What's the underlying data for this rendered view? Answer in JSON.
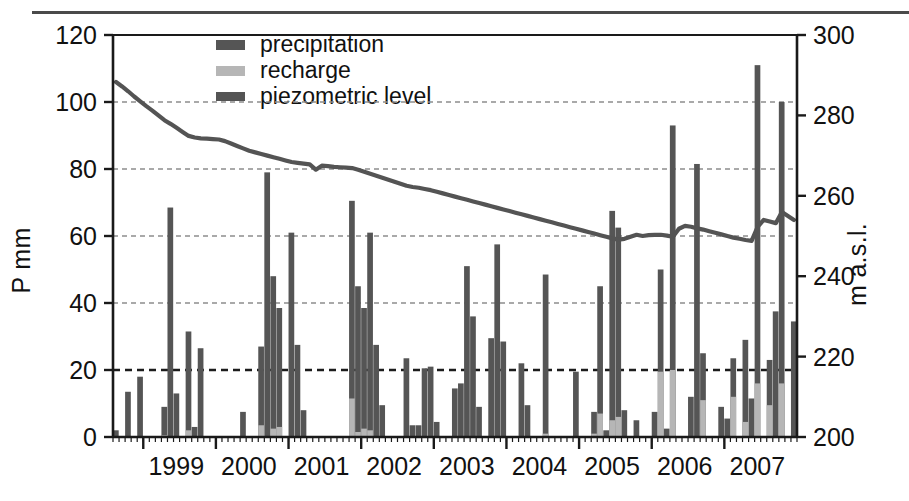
{
  "figure": {
    "axis_left_title": "P mm",
    "axis_right_title": "m a.s.l."
  },
  "legend": {
    "items": [
      {
        "label": "precipitation",
        "swatch": "bar-precip",
        "color": "#555555"
      },
      {
        "label": "recharge",
        "swatch": "bar-recharge",
        "color": "#b6b6b6"
      },
      {
        "label": "piezometric level",
        "swatch": "line-piezo",
        "color": "#545454"
      }
    ]
  },
  "axes": {
    "left_ticks": [
      "0",
      "20",
      "40",
      "60",
      "80",
      "100",
      "120"
    ],
    "right_ticks": [
      "200",
      "220",
      "240",
      "260",
      "280",
      "300"
    ],
    "x_ticks": [
      "1999",
      "2000",
      "2001",
      "2002",
      "2003",
      "2004",
      "2005",
      "2006",
      "2007"
    ]
  },
  "chart_data": {
    "type": "bar",
    "title": "",
    "xlabel": "",
    "ylabel": "P mm",
    "y2label": "m a.s.l.",
    "ylim": [
      0,
      120
    ],
    "y2lim": [
      200,
      300
    ],
    "grid": true,
    "grid_values": [
      20,
      40,
      60,
      80,
      100
    ],
    "emphasized_gridline": 20,
    "legend_position": "top-center",
    "x_tick_labels": [
      "1999",
      "2000",
      "2001",
      "2002",
      "2003",
      "2004",
      "2005",
      "2006",
      "2007"
    ],
    "x_tick_months": [
      "1999-01",
      "2000-01",
      "2001-01",
      "2002-01",
      "2003-01",
      "2004-01",
      "2005-01",
      "2006-01",
      "2007-01"
    ],
    "x_minor_tick_interval_months": 1,
    "x_range_months": [
      "1998-08",
      "2007-12"
    ],
    "months": [
      "1998-08",
      "1998-09",
      "1998-10",
      "1998-11",
      "1998-12",
      "1999-01",
      "1999-02",
      "1999-03",
      "1999-04",
      "1999-05",
      "1999-06",
      "1999-07",
      "1999-08",
      "1999-09",
      "1999-10",
      "1999-11",
      "1999-12",
      "2000-01",
      "2000-02",
      "2000-03",
      "2000-04",
      "2000-05",
      "2000-06",
      "2000-07",
      "2000-08",
      "2000-09",
      "2000-10",
      "2000-11",
      "2000-12",
      "2001-01",
      "2001-02",
      "2001-03",
      "2001-04",
      "2001-05",
      "2001-06",
      "2001-07",
      "2001-08",
      "2001-09",
      "2001-10",
      "2001-11",
      "2001-12",
      "2002-01",
      "2002-02",
      "2002-03",
      "2002-04",
      "2002-05",
      "2002-06",
      "2002-07",
      "2002-08",
      "2002-09",
      "2002-10",
      "2002-11",
      "2002-12",
      "2003-01",
      "2003-02",
      "2003-03",
      "2003-04",
      "2003-05",
      "2003-06",
      "2003-07",
      "2003-08",
      "2003-09",
      "2003-10",
      "2003-11",
      "2003-12",
      "2004-01",
      "2004-02",
      "2004-03",
      "2004-04",
      "2004-05",
      "2004-06",
      "2004-07",
      "2004-08",
      "2004-09",
      "2004-10",
      "2004-11",
      "2004-12",
      "2005-01",
      "2005-02",
      "2005-03",
      "2005-04",
      "2005-05",
      "2005-06",
      "2005-07",
      "2005-08",
      "2005-09",
      "2005-10",
      "2005-11",
      "2005-12",
      "2006-01",
      "2006-02",
      "2006-03",
      "2006-04",
      "2006-05",
      "2006-06",
      "2006-07",
      "2006-08",
      "2006-09",
      "2006-10",
      "2006-11",
      "2006-12",
      "2007-01",
      "2007-02",
      "2007-03",
      "2007-04",
      "2007-05",
      "2007-06",
      "2007-07",
      "2007-08",
      "2007-09",
      "2007-10",
      "2007-11",
      "2007-12"
    ],
    "series": [
      {
        "name": "precipitation",
        "type": "bar",
        "unit": "mm",
        "color": "#555555",
        "axis": "left",
        "values": [
          2,
          0,
          13.5,
          0,
          18,
          0,
          0,
          0,
          9,
          68.5,
          13,
          0,
          31.5,
          3,
          26.5,
          0,
          0,
          0,
          0,
          0,
          0,
          7.5,
          0,
          0,
          27,
          79,
          48,
          38.5,
          0,
          61,
          27.5,
          8,
          0,
          0,
          0,
          0,
          0,
          0,
          0,
          70.5,
          45,
          38.5,
          61,
          27.5,
          9.5,
          0,
          0,
          0,
          23.5,
          3.5,
          3.5,
          20.5,
          21,
          4.5,
          0,
          0,
          14.5,
          16,
          51,
          36,
          9,
          0,
          29.5,
          57.5,
          28.5,
          0,
          0,
          22,
          9.5,
          0,
          0,
          48.5,
          0,
          0,
          0,
          0,
          19.5,
          0,
          0,
          7.5,
          45,
          2,
          67.5,
          62.5,
          8,
          0,
          5,
          0,
          0,
          7.5,
          50,
          2.5,
          93,
          0,
          0,
          12,
          81.5,
          25,
          0,
          0,
          9,
          5.5,
          23.5,
          0,
          29,
          11.5,
          111,
          0,
          23,
          37.5,
          100,
          0,
          34.5
        ]
      },
      {
        "name": "recharge",
        "type": "bar",
        "unit": "mm",
        "color": "#b6b6b6",
        "axis": "left",
        "values": [
          0,
          0,
          0,
          0,
          0,
          0,
          0,
          0,
          0.5,
          0,
          0,
          0,
          2,
          0,
          0,
          0,
          0,
          0,
          0,
          0,
          0,
          0,
          0,
          0,
          3.5,
          0,
          2.5,
          3,
          0,
          0,
          0,
          0,
          0,
          0,
          0,
          0,
          0,
          0,
          0,
          11.5,
          1.5,
          2.5,
          2,
          0,
          0,
          0,
          0,
          0,
          0,
          0,
          0,
          0,
          0,
          0,
          0,
          0,
          0,
          0,
          0,
          0,
          0,
          0,
          0,
          0,
          0,
          0,
          0,
          0,
          0,
          0,
          0,
          1,
          0,
          0,
          0,
          0,
          0,
          0,
          0,
          1,
          7,
          0,
          5,
          6,
          0,
          0,
          0,
          0,
          0,
          0,
          19.5,
          0,
          20,
          0,
          0,
          0,
          0,
          11,
          0,
          0,
          0,
          0,
          12,
          0,
          4.5,
          0,
          16,
          0,
          9.5,
          0,
          16,
          0,
          0
        ]
      },
      {
        "name": "piezometric level",
        "type": "line",
        "unit": "m a.s.l.",
        "color": "#545454",
        "axis": "right",
        "values_m_asl": [
          288.3,
          287.2,
          286.0,
          284.7,
          283.5,
          282.3,
          281.2,
          280.0,
          278.8,
          277.9,
          276.9,
          275.9,
          274.9,
          274.5,
          274.3,
          274.2,
          274.1,
          274.0,
          273.6,
          273.0,
          272.4,
          271.8,
          271.2,
          270.8,
          270.4,
          270.0,
          269.6,
          269.2,
          268.8,
          268.4,
          268.2,
          268.0,
          267.8,
          266.5,
          267.5,
          267.4,
          267.2,
          267.1,
          267.0,
          266.9,
          266.5,
          266.0,
          265.5,
          265.0,
          264.5,
          264.0,
          263.5,
          263.0,
          262.5,
          262.2,
          262.0,
          261.7,
          261.4,
          261.0,
          260.6,
          260.2,
          259.8,
          259.4,
          259.0,
          258.6,
          258.2,
          257.8,
          257.4,
          257.0,
          256.6,
          256.2,
          255.8,
          255.4,
          255.0,
          254.6,
          254.2,
          253.8,
          253.4,
          253.0,
          252.6,
          252.2,
          251.8,
          251.4,
          251.0,
          250.6,
          250.2,
          249.8,
          249.4,
          249.1,
          249.3,
          249.8,
          250.3,
          250.0,
          250.2,
          250.3,
          250.3,
          250.1,
          249.8,
          251.8,
          252.5,
          252.3,
          251.9,
          251.6,
          251.2,
          250.8,
          250.4,
          250.0,
          249.6,
          249.3,
          249.0,
          248.8,
          252.3,
          254.0,
          253.6,
          253.2,
          256.0,
          255.0,
          254.0
        ]
      }
    ]
  }
}
